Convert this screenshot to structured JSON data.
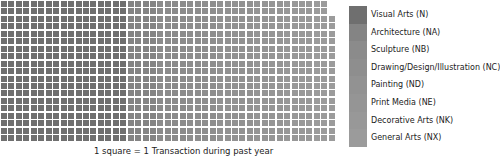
{
  "chart_data": {
    "type": "waffle",
    "title": "",
    "caption": "1 square = 1 Transaction during past year",
    "grid": {
      "columns": 45,
      "rows": 19,
      "short_top_rows": 2,
      "short_row_columns": 44,
      "total_squares": 853
    },
    "categories": [
      "Visual Arts (N)",
      "Architecture (NA)",
      "Sculpture (NB)",
      "Drawing/Design/Illustration (NC)",
      "Painting (ND)",
      "Print Media (NE)",
      "Decorative Arts (NK)",
      "General Arts (NX)"
    ],
    "colors": [
      "#6f6f6f",
      "#848484",
      "#8b8b8b",
      "#8e8e8e",
      "#929292",
      "#959595",
      "#989898",
      "#9b9b9b"
    ],
    "column_spans": [
      17,
      4,
      4,
      4,
      5,
      4,
      4,
      3
    ],
    "legend_position": "right"
  },
  "legend": {
    "items": [
      {
        "label": "Visual Arts (N)",
        "color": "#6f6f6f"
      },
      {
        "label": "Architecture (NA)",
        "color": "#848484"
      },
      {
        "label": "Sculpture (NB)",
        "color": "#8b8b8b"
      },
      {
        "label": "Drawing/Design/Illustration (NC)",
        "color": "#8e8e8e"
      },
      {
        "label": "Painting (ND)",
        "color": "#929292"
      },
      {
        "label": "Print Media (NE)",
        "color": "#959595"
      },
      {
        "label": "Decorative Arts (NK)",
        "color": "#989898"
      },
      {
        "label": "General Arts (NX)",
        "color": "#9b9b9b"
      }
    ]
  },
  "caption": "1 square = 1 Transaction during past year"
}
